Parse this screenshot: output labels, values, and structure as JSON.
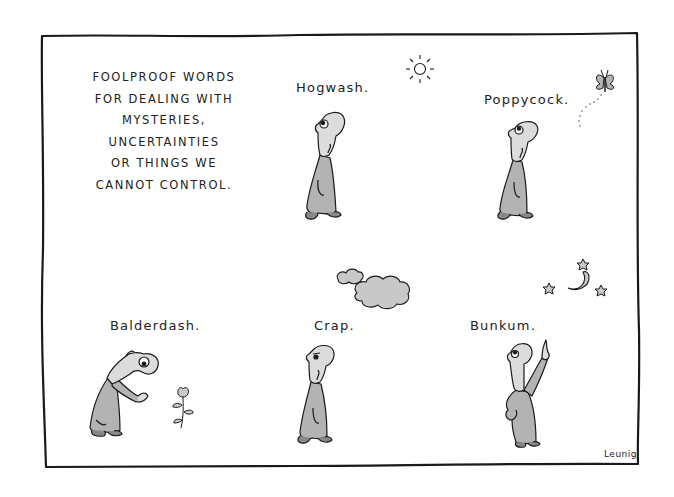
{
  "cartoon": {
    "intro_lines": [
      "FOOLPROOF WORDS",
      "FOR DEALING WITH",
      "MYSTERIES,",
      "UNCERTAINTIES",
      "OR THINGS WE",
      "CANNOT CONTROL."
    ],
    "panels": [
      {
        "word": "Hogwash.",
        "scene": "man walking looking up at sun"
      },
      {
        "word": "Poppycock.",
        "scene": "man walking looking up at butterfly"
      },
      {
        "word": "Balderdash.",
        "scene": "man bending toward flower"
      },
      {
        "word": "Crap.",
        "scene": "man walking under clouds"
      },
      {
        "word": "Bunkum.",
        "scene": "man pointing at moon and stars"
      }
    ],
    "signature": "Leunig"
  },
  "colors": {
    "ink": "#1a1a1a",
    "coat": "#b3b3b3",
    "face": "#d9d9d9",
    "background": "#ffffff"
  }
}
